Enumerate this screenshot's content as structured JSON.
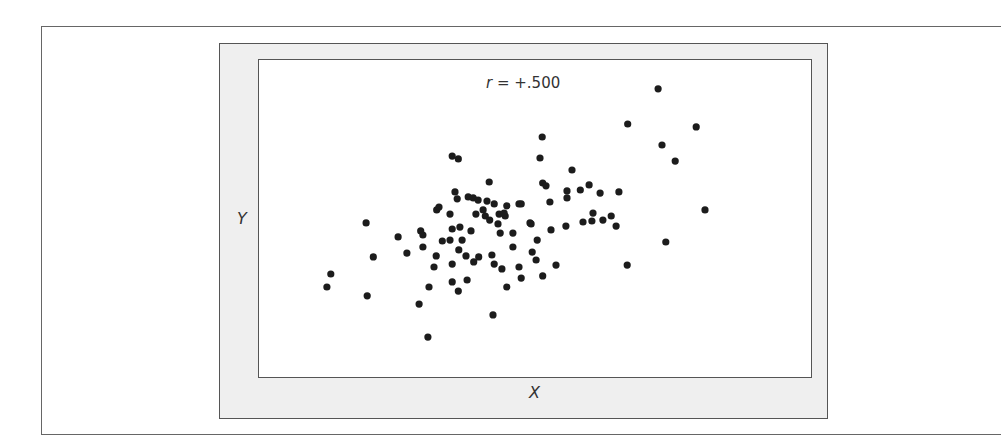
{
  "figure": {
    "annotation": {
      "variable": "r",
      "equals": " = ",
      "value": "+.500"
    },
    "x_label": "X",
    "y_label": "Y",
    "colors": {
      "dot": "#1c1c1c",
      "frame_fill": "#efefef",
      "border": "#555555",
      "background": "#ffffff"
    }
  },
  "chart_data": {
    "type": "scatter",
    "title": "r = +.500",
    "xlabel": "X",
    "ylabel": "Y",
    "grid": false,
    "legend": null,
    "note": "No axis ticks shown; coordinates are normalized 0-100 within the plot area (x left→right, y bottom→top).",
    "xlim": [
      0,
      100
    ],
    "ylim": [
      0,
      100
    ],
    "points": [
      [
        12.3,
        28.4
      ],
      [
        13.0,
        32.5
      ],
      [
        19.4,
        48.6
      ],
      [
        19.6,
        25.6
      ],
      [
        20.7,
        37.9
      ],
      [
        25.2,
        44.2
      ],
      [
        26.8,
        39.1
      ],
      [
        29.0,
        23.0
      ],
      [
        29.3,
        46.1
      ],
      [
        29.7,
        44.8
      ],
      [
        29.7,
        41.0
      ],
      [
        30.6,
        12.6
      ],
      [
        30.8,
        28.4
      ],
      [
        31.7,
        34.7
      ],
      [
        32.2,
        52.7
      ],
      [
        32.6,
        53.6
      ],
      [
        32.1,
        38.2
      ],
      [
        33.2,
        42.9
      ],
      [
        34.6,
        51.4
      ],
      [
        34.6,
        43.2
      ],
      [
        35.0,
        69.7
      ],
      [
        36.1,
        68.8
      ],
      [
        35.5,
        58.4
      ],
      [
        35.9,
        56.2
      ],
      [
        35.0,
        46.7
      ],
      [
        35.0,
        35.6
      ],
      [
        35.0,
        30.0
      ],
      [
        36.1,
        27.1
      ],
      [
        36.4,
        47.3
      ],
      [
        36.2,
        40.1
      ],
      [
        36.8,
        43.2
      ],
      [
        37.5,
        38.2
      ],
      [
        37.7,
        30.6
      ],
      [
        37.9,
        56.8
      ],
      [
        38.8,
        56.5
      ],
      [
        39.7,
        55.8
      ],
      [
        41.3,
        55.5
      ],
      [
        42.6,
        54.6
      ],
      [
        44.9,
        54.0
      ],
      [
        47.1,
        54.6
      ],
      [
        41.7,
        61.5
      ],
      [
        39.3,
        51.4
      ],
      [
        40.6,
        52.7
      ],
      [
        41.0,
        50.8
      ],
      [
        41.8,
        49.5
      ],
      [
        43.5,
        51.4
      ],
      [
        44.6,
        50.8
      ],
      [
        43.3,
        48.3
      ],
      [
        38.4,
        46.1
      ],
      [
        43.7,
        45.4
      ],
      [
        46.0,
        45.4
      ],
      [
        38.9,
        36.3
      ],
      [
        39.8,
        37.9
      ],
      [
        42.2,
        38.5
      ],
      [
        42.6,
        35.6
      ],
      [
        44.0,
        34.1
      ],
      [
        46.0,
        41.0
      ],
      [
        47.1,
        34.7
      ],
      [
        47.5,
        31.2
      ],
      [
        44.9,
        28.4
      ],
      [
        42.4,
        19.6
      ],
      [
        49.1,
        48.6
      ],
      [
        50.4,
        43.2
      ],
      [
        49.5,
        39.4
      ],
      [
        50.2,
        36.9
      ],
      [
        51.3,
        75.7
      ],
      [
        50.9,
        69.1
      ],
      [
        51.4,
        61.2
      ],
      [
        52.0,
        60.3
      ],
      [
        52.7,
        55.2
      ],
      [
        47.5,
        54.6
      ],
      [
        49.3,
        48.3
      ],
      [
        51.4,
        31.9
      ],
      [
        53.8,
        35.3
      ],
      [
        52.9,
        46.4
      ],
      [
        55.6,
        47.6
      ],
      [
        55.8,
        58.7
      ],
      [
        55.8,
        56.5
      ],
      [
        56.7,
        65.3
      ],
      [
        58.2,
        59.0
      ],
      [
        59.8,
        60.6
      ],
      [
        61.8,
        58.0
      ],
      [
        65.2,
        58.4
      ],
      [
        60.5,
        51.7
      ],
      [
        58.7,
        48.9
      ],
      [
        60.3,
        49.2
      ],
      [
        62.3,
        49.5
      ],
      [
        63.8,
        50.8
      ],
      [
        64.7,
        47.6
      ],
      [
        66.8,
        79.8
      ],
      [
        72.3,
        90.9
      ],
      [
        79.2,
        78.9
      ],
      [
        73.0,
        73.2
      ],
      [
        75.4,
        68.1
      ],
      [
        80.8,
        52.7
      ],
      [
        73.7,
        42.6
      ],
      [
        66.7,
        35.3
      ],
      [
        44.4,
        51.7
      ]
    ]
  }
}
